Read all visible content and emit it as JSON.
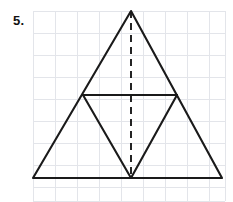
{
  "page": {
    "width": 233,
    "height": 202,
    "background_color": "#ffffff"
  },
  "problem": {
    "number_label": "5."
  },
  "grid": {
    "line_color": "#e3e5ea",
    "cell_size": 22,
    "x_start": 33,
    "x_end": 225,
    "y_start": 11,
    "y_end": 201,
    "vertical_lines": [
      33,
      55,
      77,
      99,
      121,
      143,
      165,
      187,
      209,
      225
    ],
    "horizontal_lines": [
      11,
      33,
      55,
      77,
      99,
      121,
      143,
      165,
      187,
      201
    ]
  },
  "figure": {
    "name": "triangle-with-midsegment-and-altitude",
    "stroke_color": "#1a1a1a",
    "stroke_width": 2.1,
    "points": {
      "apex": [
        131,
        11
      ],
      "bottom_left": [
        33,
        178
      ],
      "bottom_right": [
        222,
        178
      ],
      "left_midpoint": [
        83,
        95
      ],
      "right_midpoint": [
        177,
        95
      ],
      "base_midpoint": [
        131,
        178
      ]
    },
    "outer_triangle_path": "M 33 178 L 131 11 L 222 178 Z",
    "midsegment_path": "M 83 95 L 177 95",
    "inner_triangle_left_path": "M 83 95 L 131 178",
    "inner_triangle_right_path": "M 177 95 L 131 178",
    "altitude": {
      "path": "M 131 11 L 131 178",
      "style": "dashed",
      "dash_pattern": "7 5",
      "stroke_width": 1.9
    }
  }
}
